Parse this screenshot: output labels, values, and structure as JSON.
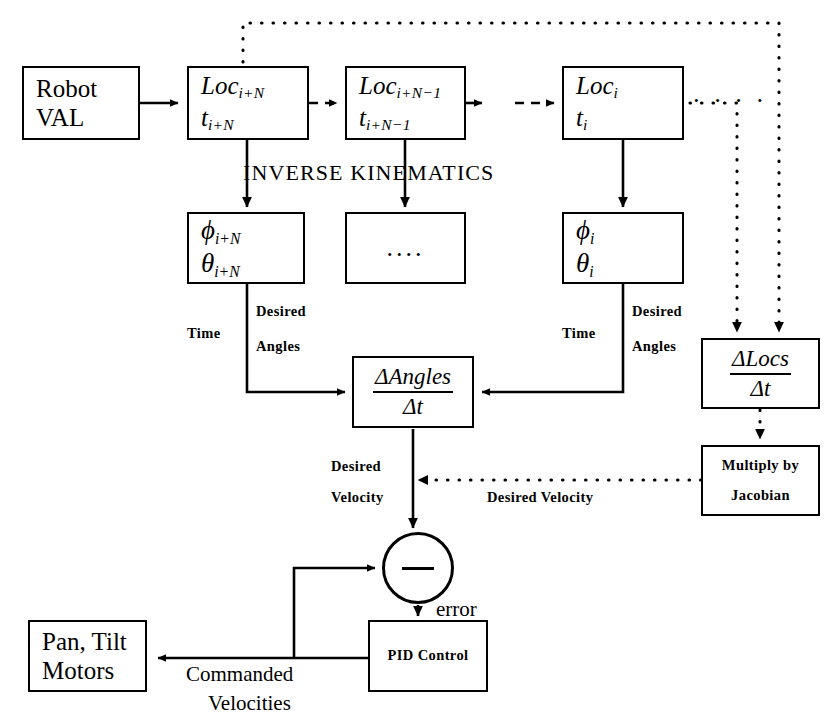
{
  "diagram": {
    "section_label": "INVERSE KINEMATICS",
    "stroke_color": "#000000",
    "background_color": "#ffffff"
  },
  "nodes": {
    "robot_val": {
      "line1": "Robot",
      "line2": "VAL"
    },
    "loc_ipn": {
      "line1_base": "Loc",
      "line1_sub": "i+N",
      "line2_base": "t",
      "line2_sub": "i+N"
    },
    "loc_ipn1": {
      "line1_base": "Loc",
      "line1_sub": "i+N−1",
      "line2_base": "t",
      "line2_sub": "i+N−1"
    },
    "loc_i": {
      "line1_base": "Loc",
      "line1_sub": "i",
      "line2_base": "t",
      "line2_sub": "i"
    },
    "angles_ipn": {
      "line1_base": "ϕ",
      "line1_sub": "i+N",
      "line2_base": "θ",
      "line2_sub": "i+N"
    },
    "angles_ellipsis": {
      "text": "...."
    },
    "angles_i": {
      "line1_base": "ϕ",
      "line1_sub": "i",
      "line2_base": "θ",
      "line2_sub": "i"
    },
    "delta_angles": {
      "numerator": "ΔAngles",
      "denominator": "Δt"
    },
    "delta_locs": {
      "numerator": "ΔLocs",
      "denominator": "Δt"
    },
    "multiply_jacobian": {
      "line1": "Multiply by",
      "line2": "Jacobian"
    },
    "pid_control": {
      "text": "PID Control"
    },
    "pan_tilt_motors": {
      "line1": "Pan, Tilt",
      "line2": "Motors"
    },
    "summing_junction": {
      "sign": "−"
    }
  },
  "edge_labels": {
    "time_left": "Time",
    "desired_left_line1": "Desired",
    "desired_left_line2": "Angles",
    "time_right": "Time",
    "desired_right_line1": "Desired",
    "desired_right_line2": "Angles",
    "desired_velocity_left_line1": "Desired",
    "desired_velocity_left_line2": "Velocity",
    "desired_velocity_dotted": "Desired Velocity",
    "error": "error",
    "commanded_line1": "Commanded",
    "commanded_line2": "Velocities"
  },
  "ellipses": {
    "top_row_after_loc_i": "·  ·  ·  ·"
  }
}
